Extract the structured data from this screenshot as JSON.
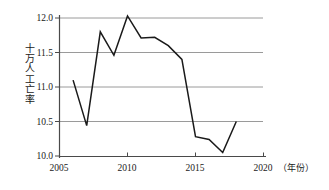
{
  "chart_data": {
    "type": "line",
    "title": "",
    "subtitle": "",
    "xlabel": "年份",
    "xlabel_display": "（年份）",
    "ylabel": "十万人工亡率",
    "ylabel_chars": [
      "十",
      "万",
      "人",
      "工",
      "亡",
      "率"
    ],
    "x": [
      2006,
      2007,
      2008,
      2009,
      2010,
      2011,
      2012,
      2013,
      2014,
      2015,
      2016,
      2017,
      2018
    ],
    "values": [
      11.1,
      10.44,
      11.8,
      11.46,
      12.03,
      11.71,
      11.72,
      11.6,
      11.4,
      10.28,
      10.24,
      10.05,
      10.5
    ],
    "series": [
      {
        "name": "十万人工亡率",
        "values": [
          11.1,
          10.44,
          11.8,
          11.46,
          12.03,
          11.71,
          11.72,
          11.6,
          11.4,
          10.28,
          10.24,
          10.05,
          10.5
        ]
      }
    ],
    "xlim": [
      2005,
      2020
    ],
    "ylim": [
      10.0,
      12.0
    ],
    "xticks": [
      2005,
      2010,
      2015,
      2020
    ],
    "xtick_labels": [
      "2005",
      "2010",
      "2015",
      "2020"
    ],
    "yticks": [
      10.0,
      10.5,
      11.0,
      11.5,
      12.0
    ],
    "ytick_labels": [
      "10.0",
      "10.5",
      "11.0",
      "11.5",
      "12.0"
    ],
    "grid": true,
    "grid_axis": "y",
    "legend": false,
    "legend_position": "none",
    "line_color": "#1a1a1a",
    "grid_color": "#9a9a9a",
    "axis_color": "#5a5a5a",
    "background_color": "#ffffff"
  }
}
